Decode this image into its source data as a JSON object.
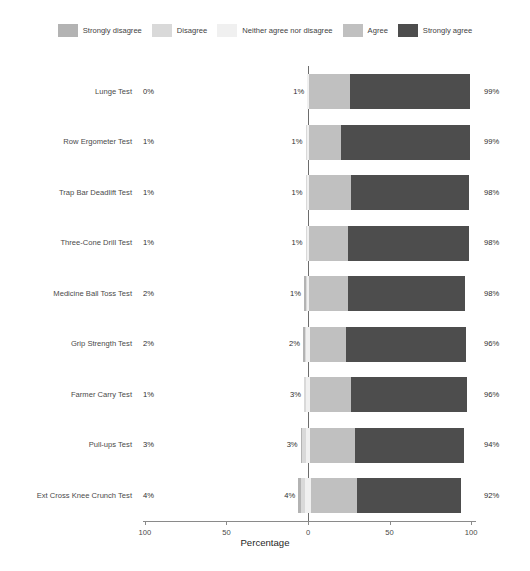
{
  "chart_data": {
    "type": "bar",
    "subtype": "diverging-stacked-likert",
    "title": "",
    "xlabel": "Percentage",
    "ylabel": "",
    "xlim": [
      -100,
      100
    ],
    "xticks": [
      100,
      50,
      0,
      50,
      100
    ],
    "grid": false,
    "legend_position": "top",
    "legend": [
      {
        "label": "Strongly disagree",
        "color": "#b3b3b3"
      },
      {
        "label": "Disagree",
        "color": "#d9d9d9"
      },
      {
        "label": "Neither agree nor disagree",
        "color": "#f0f0f0"
      },
      {
        "label": "Agree",
        "color": "#c0c0c0"
      },
      {
        "label": "Strongly agree",
        "color": "#4d4d4d"
      }
    ],
    "series": [
      {
        "name": "Strongly disagree",
        "color": "#b3b3b3",
        "values": [
          0,
          0,
          0,
          0,
          1,
          1,
          0,
          1,
          2
        ]
      },
      {
        "name": "Disagree",
        "color": "#d9d9d9",
        "values": [
          0,
          1,
          1,
          1,
          1,
          1,
          1,
          2,
          2
        ]
      },
      {
        "name": "Neither agree nor disagree",
        "color": "#f0f0f0",
        "values": [
          1,
          1,
          1,
          1,
          1,
          2,
          3,
          3,
          4
        ]
      },
      {
        "name": "Agree",
        "color": "#c0c0c0",
        "values": [
          25,
          20,
          26,
          24,
          24,
          22,
          25,
          27,
          28
        ]
      },
      {
        "name": "Strongly agree",
        "color": "#4d4d4d",
        "values": [
          74,
          79,
          72,
          74,
          72,
          74,
          71,
          67,
          64
        ]
      }
    ],
    "categories": [
      "Lunge Test",
      "Row Ergometer Test",
      "Trap Bar Deadlift Test",
      "Three-Cone Drill Test",
      "Medicine Ball Toss Test",
      "Grip Strength Test",
      "Farmer Carry Test",
      "Pull-ups Test",
      "Ext Cross Knee Crunch Test"
    ],
    "rows": [
      {
        "category": "Lunge Test",
        "negative_label": "0%",
        "neutral_label": "1%",
        "positive_label": "99%",
        "strongly_disagree": 0,
        "disagree": 0,
        "neither": 1,
        "agree": 25,
        "strongly_agree": 74
      },
      {
        "category": "Row Ergometer Test",
        "negative_label": "1%",
        "neutral_label": "1%",
        "positive_label": "99%",
        "strongly_disagree": 0,
        "disagree": 1,
        "neither": 1,
        "agree": 20,
        "strongly_agree": 79
      },
      {
        "category": "Trap Bar Deadlift Test",
        "negative_label": "1%",
        "neutral_label": "1%",
        "positive_label": "98%",
        "strongly_disagree": 0,
        "disagree": 1,
        "neither": 1,
        "agree": 26,
        "strongly_agree": 72
      },
      {
        "category": "Three-Cone Drill Test",
        "negative_label": "1%",
        "neutral_label": "1%",
        "positive_label": "98%",
        "strongly_disagree": 0,
        "disagree": 1,
        "neither": 1,
        "agree": 24,
        "strongly_agree": 74
      },
      {
        "category": "Medicine Ball Toss Test",
        "negative_label": "2%",
        "neutral_label": "1%",
        "positive_label": "98%",
        "strongly_disagree": 1,
        "disagree": 1,
        "neither": 1,
        "agree": 24,
        "strongly_agree": 72
      },
      {
        "category": "Grip Strength Test",
        "negative_label": "2%",
        "neutral_label": "2%",
        "positive_label": "96%",
        "strongly_disagree": 1,
        "disagree": 1,
        "neither": 2,
        "agree": 22,
        "strongly_agree": 74
      },
      {
        "category": "Farmer Carry Test",
        "negative_label": "1%",
        "neutral_label": "3%",
        "positive_label": "96%",
        "strongly_disagree": 0,
        "disagree": 1,
        "neither": 3,
        "agree": 25,
        "strongly_agree": 71
      },
      {
        "category": "Pull-ups Test",
        "negative_label": "3%",
        "neutral_label": "3%",
        "positive_label": "94%",
        "strongly_disagree": 1,
        "disagree": 2,
        "neither": 3,
        "agree": 27,
        "strongly_agree": 67
      },
      {
        "category": "Ext Cross Knee Crunch Test",
        "negative_label": "4%",
        "neutral_label": "4%",
        "positive_label": "92%",
        "strongly_disagree": 2,
        "disagree": 2,
        "neither": 4,
        "agree": 28,
        "strongly_agree": 64
      }
    ],
    "axis_tick_labels": [
      "100",
      "50",
      "0",
      "50",
      "100"
    ]
  }
}
